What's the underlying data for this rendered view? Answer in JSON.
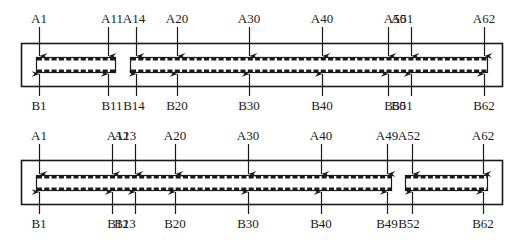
{
  "diagram": {
    "connectors": [
      {
        "id": "connector-top",
        "outer": {
          "x": 21,
          "y": 43,
          "w": 481,
          "h": 43
        },
        "slots": [
          {
            "x": 36,
            "y": 57,
            "w": 79,
            "h": 15
          },
          {
            "x": 130,
            "y": 57,
            "w": 357,
            "h": 15
          }
        ],
        "pins": [
          {
            "a": "A1",
            "b": "B1",
            "x": 39,
            "ax": 39,
            "bx": 39
          },
          {
            "a": "A11",
            "b": "B11",
            "x": 112,
            "ax": 108,
            "bx": 108
          },
          {
            "a": "A14",
            "b": "B14",
            "x": 134,
            "ax": 136,
            "bx": 136
          },
          {
            "a": "A20",
            "b": "B20",
            "x": 177,
            "ax": 177,
            "bx": 177
          },
          {
            "a": "A30",
            "b": "B30",
            "x": 249,
            "ax": 249,
            "bx": 249
          },
          {
            "a": "A40",
            "b": "B40",
            "x": 322,
            "ax": 322,
            "bx": 322
          },
          {
            "a": "A50",
            "b": "B50",
            "x": 395,
            "ax": 388,
            "bx": 388
          },
          {
            "a": "A51",
            "b": "B51",
            "x": 402,
            "ax": 411,
            "bx": 411
          },
          {
            "a": "A62",
            "b": "B62",
            "x": 484,
            "ax": 484,
            "bx": 484
          }
        ]
      },
      {
        "id": "connector-bottom",
        "outer": {
          "x": 21,
          "y": 160,
          "w": 481,
          "h": 44
        },
        "slots": [
          {
            "x": 36,
            "y": 175,
            "w": 355,
            "h": 15
          },
          {
            "x": 405,
            "y": 175,
            "w": 82,
            "h": 15
          }
        ],
        "pins": [
          {
            "a": "A1",
            "b": "B1",
            "x": 39,
            "ax": 39,
            "bx": 39
          },
          {
            "a": "A12",
            "b": "B12",
            "x": 118,
            "ax": 112,
            "bx": 112
          },
          {
            "a": "A13",
            "b": "B13",
            "x": 125,
            "ax": 135,
            "bx": 135
          },
          {
            "a": "A20",
            "b": "B20",
            "x": 175,
            "ax": 175,
            "bx": 175
          },
          {
            "a": "A30",
            "b": "B30",
            "x": 248,
            "ax": 248,
            "bx": 248
          },
          {
            "a": "A40",
            "b": "B40",
            "x": 321,
            "ax": 321,
            "bx": 321
          },
          {
            "a": "A49",
            "b": "B49",
            "x": 387,
            "ax": 387,
            "bx": 387
          },
          {
            "a": "A52",
            "b": "B52",
            "x": 409,
            "ax": 412,
            "bx": 412
          },
          {
            "a": "A62",
            "b": "B62",
            "x": 483,
            "ax": 483,
            "bx": 483
          }
        ]
      }
    ],
    "colors": {
      "stroke": "#1a1a1a",
      "background": "#ffffff"
    }
  }
}
